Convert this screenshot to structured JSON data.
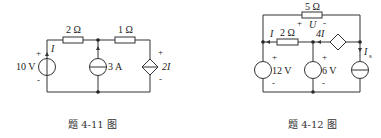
{
  "figures": [
    {
      "caption": "题 4-11 图",
      "components": {
        "voltage_source": {
          "label": "10 V",
          "plus": "+",
          "minus": "-"
        },
        "current_label": "I",
        "resistor_1": {
          "label": "2 Ω"
        },
        "current_source": {
          "label": "3 A"
        },
        "resistor_2": {
          "label": "1 Ω"
        },
        "dependent_voltage_source": {
          "label": "2I",
          "plus": "+",
          "minus": "-"
        }
      }
    },
    {
      "caption": "题 4-12 图",
      "components": {
        "resistor_top": {
          "label": "5 Ω"
        },
        "voltage_U": {
          "label": "U",
          "plus": "+",
          "minus": "-"
        },
        "current_label": "I",
        "resistor_mid": {
          "label": "2 Ω"
        },
        "dependent_current_source": {
          "label": "4I"
        },
        "voltage_source_1": {
          "label": "12 V",
          "plus": "+",
          "minus": "-"
        },
        "voltage_source_2": {
          "label": "6 V",
          "plus": "+",
          "minus": "-"
        },
        "current_source": {
          "label": "I",
          "subscript": "s"
        }
      }
    }
  ]
}
